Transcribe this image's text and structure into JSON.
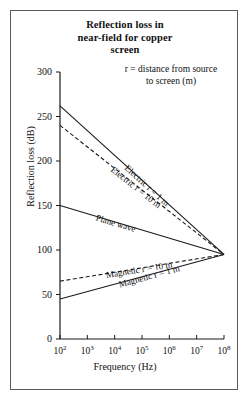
{
  "figure": {
    "title": "Reflection loss in near-field for copper screen",
    "note": "r = distance from source to screen (m)"
  },
  "chart_data": {
    "type": "line",
    "title": "Reflection loss in near-field for copper screen",
    "annotation": "r = distance from source to screen (m)",
    "xlabel": "Frequency (Hz)",
    "ylabel": "Reflection loss (dB)",
    "xscale": "log",
    "xlim": [
      100,
      100000000
    ],
    "ylim": [
      0,
      300
    ],
    "yticks": [
      300,
      250,
      200,
      150,
      100,
      50,
      0
    ],
    "ytick_labels": [
      "300",
      "250",
      "200",
      "150",
      "100",
      "50",
      "0"
    ],
    "xticks": [
      100,
      1000,
      10000,
      100000,
      1000000,
      10000000,
      100000000
    ],
    "xtick_labels": [
      "10²",
      "10³",
      "10⁴",
      "10⁵",
      "10⁶",
      "10⁷",
      "10⁸"
    ],
    "xtick_mantissa": [
      "10",
      "10",
      "10",
      "10",
      "10",
      "10",
      "10"
    ],
    "xtick_exponent": [
      "2",
      "3",
      "4",
      "5",
      "6",
      "7",
      "8"
    ],
    "grid": false,
    "legend": "inline-curve-labels",
    "accent_color": "#1a1a1a",
    "series": [
      {
        "name": "Electric r = 1 m",
        "style": "solid",
        "label": "Electric r = 1 m",
        "x": [
          100,
          100000000
        ],
        "values": [
          262,
          95
        ]
      },
      {
        "name": "Electric r = 10 m",
        "style": "dashed",
        "label": "Electric r = 10 m",
        "x": [
          100,
          100000000
        ],
        "values": [
          240,
          95
        ]
      },
      {
        "name": "Plane wave",
        "style": "solid",
        "label": "Plane wave",
        "x": [
          100,
          100000000
        ],
        "values": [
          150,
          95
        ]
      },
      {
        "name": "Magnetic r = 10 m",
        "style": "dashed",
        "label": "Magnetic r = 10 m",
        "x": [
          100,
          100000000
        ],
        "values": [
          65,
          95
        ]
      },
      {
        "name": "Magnetic r = 1 m",
        "style": "solid",
        "label": "Magnetic r = 1 m",
        "x": [
          100,
          100000000
        ],
        "values": [
          45,
          95
        ]
      }
    ]
  }
}
